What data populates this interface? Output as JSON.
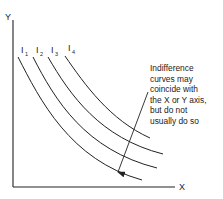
{
  "diagram": {
    "type": "indifference-curves",
    "axes": {
      "x_label": "X",
      "y_label": "Y"
    },
    "curves": [
      {
        "label": "I",
        "subscript": "1"
      },
      {
        "label": "I",
        "subscript": "2"
      },
      {
        "label": "I",
        "subscript": "3"
      },
      {
        "label": "I",
        "subscript": "4"
      }
    ],
    "annotation": {
      "lines": [
        "Indifference",
        "curves may",
        "coincide with",
        "the X or Y axis,",
        "but do not",
        "usually do so"
      ]
    },
    "colors": {
      "ink": "#222222",
      "background": "#ffffff"
    }
  }
}
